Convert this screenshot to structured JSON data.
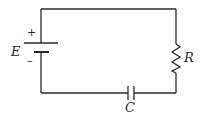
{
  "diagram": {
    "type": "circuit",
    "components": {
      "battery": {
        "label": "E",
        "positive_sign": "+",
        "negative_sign": "–"
      },
      "resistor": {
        "label": "R"
      },
      "capacitor": {
        "label": "C"
      }
    },
    "colors": {
      "stroke": "#2a2a2a",
      "background": "#ffffff"
    }
  }
}
